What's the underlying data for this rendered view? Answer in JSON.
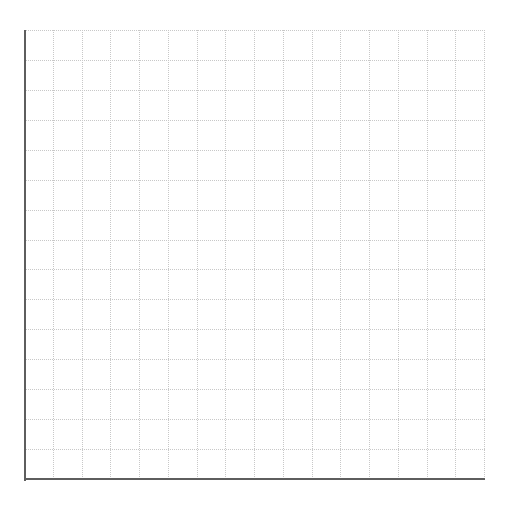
{
  "chart_data": {
    "type": "line",
    "title": "",
    "xlabel": "",
    "ylabel": "",
    "series": [],
    "x": [],
    "grid": {
      "on": true,
      "style": "dotted",
      "color": "#c8c8c8",
      "columns": 16,
      "rows": 15
    },
    "axes": {
      "color": "#5e5e5e",
      "visible": [
        "left",
        "bottom"
      ]
    },
    "legend": null
  }
}
